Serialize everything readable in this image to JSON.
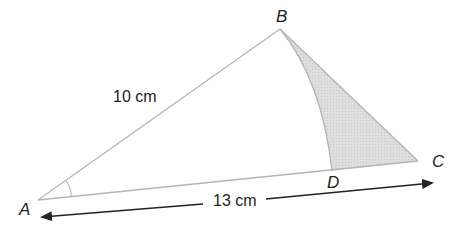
{
  "diagram": {
    "points": {
      "A": {
        "label": "A"
      },
      "B": {
        "label": "B"
      },
      "C": {
        "label": "C"
      },
      "D": {
        "label": "D"
      }
    },
    "measurements": {
      "AB": "10 cm",
      "AC": "13 cm"
    },
    "colors": {
      "edge": "#b5b5b5",
      "shade": "#d9d9d9",
      "arrow": "#222222"
    }
  }
}
